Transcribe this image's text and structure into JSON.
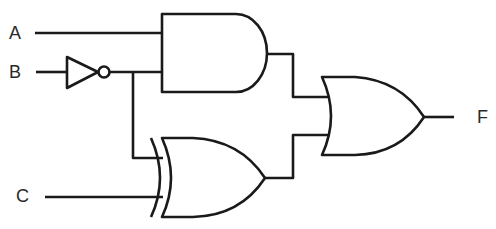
{
  "diagram": {
    "type": "logic-circuit",
    "inputs": [
      {
        "name": "A",
        "label": "A"
      },
      {
        "name": "B",
        "label": "B"
      },
      {
        "name": "C",
        "label": "C"
      }
    ],
    "output": {
      "name": "F",
      "label": "F"
    },
    "gates": [
      {
        "id": "not1",
        "type": "NOT",
        "inputs": [
          "B"
        ],
        "output": "B'"
      },
      {
        "id": "and1",
        "type": "AND",
        "inputs": [
          "A",
          "B'"
        ],
        "output": "AB'"
      },
      {
        "id": "xor1",
        "type": "XOR",
        "inputs": [
          "B'",
          "C"
        ],
        "output": "B' XOR C"
      },
      {
        "id": "or1",
        "type": "OR",
        "inputs": [
          "AB'",
          "B' XOR C"
        ],
        "output": "F"
      }
    ],
    "expression": "F = AB' + (B' ⊕ C)",
    "stroke_color": "#1a1a1a",
    "background": "#ffffff"
  }
}
